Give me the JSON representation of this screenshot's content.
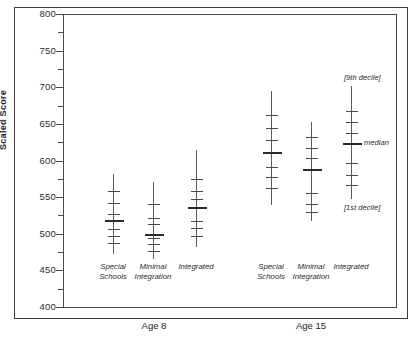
{
  "chart_data": {
    "type": "line",
    "title": "",
    "xlabel": "",
    "ylabel": "Scaled Score",
    "ylim": [
      400,
      800
    ],
    "yticks_major": [
      400,
      450,
      500,
      550,
      600,
      650,
      700,
      750,
      800
    ],
    "yticks_minor": [
      425,
      475,
      525,
      575,
      625,
      675,
      725,
      775
    ],
    "grid": false,
    "legend": "none",
    "annotations": [
      {
        "text": "[9th decile]",
        "target_group": "age15-integrated",
        "position": "above-top"
      },
      {
        "text": "median",
        "target_group": "age15-integrated",
        "position": "right-of-median"
      },
      {
        "text": "[1st decile]",
        "target_group": "age15-integrated",
        "position": "below-bottom"
      }
    ],
    "x_groups": [
      {
        "age": "Age 8",
        "groups": [
          {
            "label": "Special Schools",
            "label_lines": [
              "Special",
              "Schools"
            ],
            "min": 473,
            "max": 582,
            "median": 519,
            "deciles": [
              473,
              488,
              497,
              507,
              519,
              527,
              542,
              558,
              582
            ]
          },
          {
            "label": "Minimal Integration",
            "label_lines": [
              "Minimal",
              "Integration"
            ],
            "min": 466,
            "max": 570,
            "median": 500,
            "deciles": [
              466,
              477,
              486,
              494,
              500,
              513,
              522,
              540,
              570
            ]
          },
          {
            "label": "Integrated",
            "label_lines": [
              "Integrated"
            ],
            "min": 482,
            "max": 614,
            "median": 536,
            "deciles": [
              482,
              497,
              508,
              518,
              536,
              547,
              558,
              575,
              614
            ]
          }
        ]
      },
      {
        "age": "Age 15",
        "groups": [
          {
            "label": "Special Schools",
            "label_lines": [
              "Special",
              "Schools"
            ],
            "min": 539,
            "max": 695,
            "median": 612,
            "deciles": [
              539,
              562,
              577,
              591,
              612,
              628,
              645,
              662,
              695
            ]
          },
          {
            "label": "Minimal Integration",
            "label_lines": [
              "Minimal",
              "Integration"
            ],
            "min": 517,
            "max": 652,
            "median": 588,
            "deciles": [
              517,
              530,
              541,
              556,
              588,
              604,
              617,
              632,
              652
            ]
          },
          {
            "label": "Integrated",
            "label_lines": [
              "Integrated"
            ],
            "min": 547,
            "max": 702,
            "median": 624,
            "deciles": [
              547,
              566,
              580,
              596,
              624,
              638,
              652,
              668,
              702
            ]
          }
        ]
      }
    ],
    "age_labels": [
      "Age 8",
      "Age 15"
    ]
  },
  "colors": {
    "axis": "#4a4a4a",
    "spike": "#5a5a5a",
    "median": "#2a2a2a",
    "text": "#2b2b2b",
    "background": "#ffffff"
  }
}
